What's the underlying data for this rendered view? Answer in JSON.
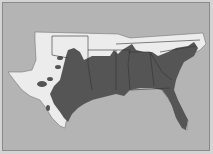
{
  "map": {
    "subject": "Southern United States (Texas to Florida)",
    "colors": {
      "background": "#b4b4b4",
      "land_light": "#ececec",
      "land_dark": "#555555",
      "state_border": "#333333",
      "frame": "#8a8a8a"
    },
    "legend": []
  }
}
